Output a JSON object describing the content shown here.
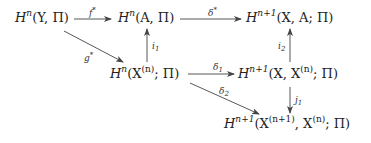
{
  "diagram": {
    "type": "commutative-diagram",
    "nodes": {
      "hnY": {
        "H": "H",
        "sup": "n",
        "args": "(Y, Π)"
      },
      "hnA": {
        "H": "H",
        "sup": "n",
        "args": "(A, Π)"
      },
      "hn1XA": {
        "H": "H",
        "sup": "n+1",
        "args": "(X, A; Π)"
      },
      "hnXn": {
        "H": "H",
        "sup": "n",
        "open": "(X",
        "inner_sup": "(n)",
        "close": "; Π)"
      },
      "hn1XXn": {
        "H": "H",
        "sup": "n+1",
        "open": "(X, X",
        "inner_sup": "(n)",
        "close": "; Π)"
      },
      "hn1Xn1Xn": {
        "H": "H",
        "sup": "n+1",
        "open": "(X",
        "inner_sup1": "(n+1)",
        "mid": ", X",
        "inner_sup2": "(n)",
        "close": "; Π)"
      }
    },
    "arrows": {
      "f_star": {
        "base": "f",
        "mark": "*",
        "from": "H^n(Y,Π)",
        "to": "H^n(A,Π)"
      },
      "delta_star": {
        "base": "δ",
        "mark": "*",
        "from": "H^n(A,Π)",
        "to": "H^{n+1}(X,A;Π)"
      },
      "g_star": {
        "base": "g",
        "mark": "*",
        "from": "H^n(Y,Π)",
        "to": "H^n(X^(n);Π)"
      },
      "i1": {
        "base": "i",
        "sub": "1",
        "from": "H^n(X^(n);Π)",
        "to": "H^n(A,Π)"
      },
      "i2": {
        "base": "i",
        "sub": "2",
        "from": "H^{n+1}(X,X^(n);Π)",
        "to": "H^{n+1}(X,A;Π)"
      },
      "delta1": {
        "base": "δ",
        "sub": "1",
        "from": "H^n(X^(n);Π)",
        "to": "H^{n+1}(X,X^(n);Π)"
      },
      "delta2": {
        "base": "δ",
        "sub": "2",
        "from": "H^n(X^(n);Π)",
        "to": "H^{n+1}(X^(n+1),X^(n);Π)"
      },
      "j1": {
        "base": "j",
        "sub": "1",
        "from": "H^{n+1}(X,X^(n);Π)",
        "to": "H^{n+1}(X^(n+1),X^(n);Π)"
      }
    },
    "colors": {
      "ink": "#222222",
      "arrow": "#444444",
      "background": "#ffffff"
    }
  }
}
